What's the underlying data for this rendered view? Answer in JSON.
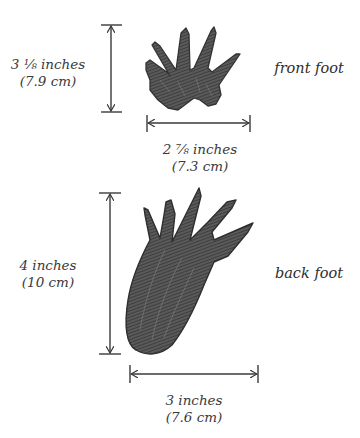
{
  "colors": {
    "ink": "#3a3a3a",
    "foot_fill": "#4a4a4a",
    "foot_light": "#8a8a8a",
    "background": "#ffffff"
  },
  "front_foot": {
    "name": "front foot",
    "height": {
      "inches": "3 ⅛ inches",
      "cm": "(7.9 cm)"
    },
    "width": {
      "inches": "2 ⅞ inches",
      "cm": "(7.3 cm)"
    }
  },
  "back_foot": {
    "name": "back foot",
    "height": {
      "inches": "4 inches",
      "cm": "(10 cm)"
    },
    "width": {
      "inches": "3 inches",
      "cm": "(7.6 cm)"
    }
  }
}
